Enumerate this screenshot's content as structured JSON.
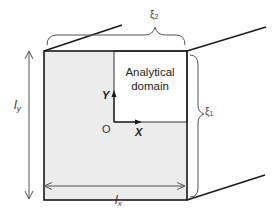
{
  "diagram": {
    "domain_label_line1": "Analytical",
    "domain_label_line2": "domain",
    "origin_label": "O",
    "axis_x_label": "X",
    "axis_y_label": "Y",
    "dim_x": {
      "symbol": "l",
      "subscript": "x"
    },
    "dim_y": {
      "symbol": "l",
      "subscript": "y"
    },
    "xi_1": {
      "symbol": "ξ",
      "subscript": "1"
    },
    "xi_2": {
      "symbol": "ξ",
      "subscript": "2"
    },
    "colors": {
      "shaded_region": "#ececec",
      "line": "#1a1a1a",
      "dimension_line": "#555555",
      "background": "#ffffff"
    }
  }
}
